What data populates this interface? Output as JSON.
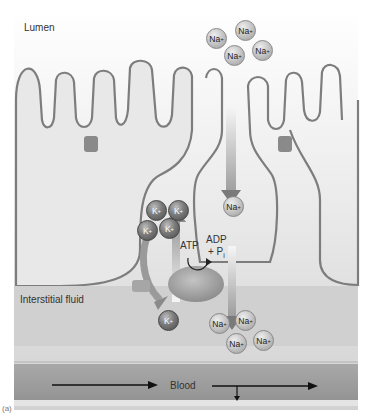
{
  "figure": {
    "regions": {
      "lumen": "Lumen",
      "interstitial": "Interstitial fluid",
      "blood": "Blood"
    },
    "pump": {
      "atp": "ATP",
      "adp": "ADP",
      "plus_pi": "+ P",
      "pi_subscript": "i"
    },
    "ions": {
      "na_symbol": "Na",
      "k_symbol": "K",
      "charge": "+"
    },
    "panel_label": "(a)",
    "colors": {
      "background_lumen": "#f2f2f2",
      "cell_fill": "#e6e6e6",
      "membrane": "#7d7d7d",
      "interstitial": "#cfcfcf",
      "blood": "#9e9e9e",
      "arrow": "#6e6e6e"
    }
  }
}
